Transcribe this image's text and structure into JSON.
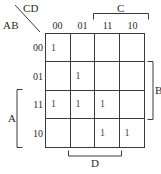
{
  "figure": {
    "type": "karnaugh-map",
    "variables": [
      "A",
      "B",
      "C",
      "D"
    ]
  },
  "corner": {
    "top_label": "CD",
    "bottom_label": "AB"
  },
  "columns": {
    "headers": [
      "00",
      "01",
      "11",
      "10"
    ]
  },
  "rows": {
    "headers": [
      "00",
      "01",
      "11",
      "10"
    ]
  },
  "cells": [
    [
      "1",
      "",
      "",
      ""
    ],
    [
      "",
      "1",
      "",
      ""
    ],
    [
      "1",
      "1",
      "1",
      ""
    ],
    [
      "",
      "",
      "1",
      "1"
    ]
  ],
  "brackets": {
    "c": {
      "label": "C",
      "spans": [
        "11",
        "10"
      ],
      "side": "top"
    },
    "b": {
      "label": "B",
      "spans": [
        "01",
        "11"
      ],
      "side": "right"
    },
    "a": {
      "label": "A",
      "spans": [
        "11",
        "10"
      ],
      "side": "left"
    },
    "d": {
      "label": "D",
      "spans": [
        "01",
        "11"
      ],
      "side": "bottom"
    }
  },
  "colors": {
    "grid_line": "#3a3a3a",
    "text": "#2b2b2b",
    "cell_value": "#4a4a4a",
    "background": "#ffffff"
  }
}
